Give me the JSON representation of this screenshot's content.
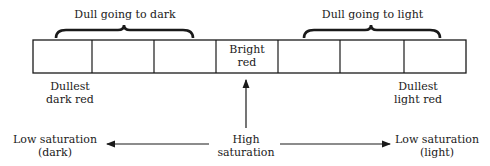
{
  "diagram": {
    "type": "saturation-scale",
    "colors": {
      "line": "#1a1a1a",
      "background": "#ffffff"
    },
    "brackets": {
      "left": {
        "label": "Dull going to dark"
      },
      "right": {
        "label": "Dull going to light"
      }
    },
    "cells": [
      {
        "label": ""
      },
      {
        "label": ""
      },
      {
        "label": ""
      },
      {
        "label_line1": "Bright",
        "label_line2": "red"
      },
      {
        "label": ""
      },
      {
        "label": ""
      },
      {
        "label": ""
      }
    ],
    "end_labels": {
      "left": {
        "line1": "Dullest",
        "line2": "dark red"
      },
      "right": {
        "line1": "Dullest",
        "line2": "light red"
      }
    },
    "axis": {
      "center": {
        "line1": "High",
        "line2": "saturation"
      },
      "left": {
        "line1": "Low saturation",
        "line2": "(dark)"
      },
      "right": {
        "line1": "Low saturation",
        "line2": "(light)"
      }
    }
  }
}
